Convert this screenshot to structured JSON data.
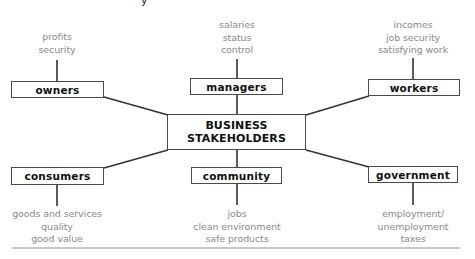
{
  "diagram": {
    "title": "BUSINESS STAKEHOLDERS",
    "center": {
      "line1": "BUSINESS",
      "line2": "STAKEHOLDERS"
    },
    "corner_mark": "y",
    "stakeholders": {
      "owners": {
        "label": "owners",
        "interests": [
          "profits",
          "security"
        ]
      },
      "managers": {
        "label": "managers",
        "interests": [
          "salaries",
          "status",
          "control"
        ]
      },
      "workers": {
        "label": "workers",
        "interests": [
          "incomes",
          "job security",
          "satisfying work"
        ]
      },
      "consumers": {
        "label": "consumers",
        "interests": [
          "goods and services",
          "quality",
          "good value"
        ]
      },
      "community": {
        "label": "community",
        "interests": [
          "jobs",
          "clean environment",
          "safe products"
        ]
      },
      "government": {
        "label": "government",
        "interests": [
          "employment/",
          "unemployment",
          "taxes"
        ]
      }
    },
    "colors": {
      "box_border": "#4a4a4a",
      "connector": "#333333",
      "label_text": "#111111",
      "interest_text": "#8a8a8a",
      "rule": "#c8c8c8"
    }
  }
}
